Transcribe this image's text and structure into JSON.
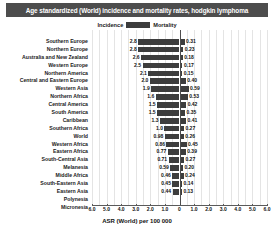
{
  "chart_data": {
    "type": "bar",
    "subtype": "diverging-butterfly",
    "title": "Age standardized (World) incidence and mortality rates, hodgkin lymphoma",
    "xlabel": "ASR (World) per 100 000",
    "ylabel": "",
    "grid": true,
    "legend_position": "top-center",
    "axis": {
      "left_ticks": [
        "6.0",
        "5.0",
        "4.0",
        "3.0",
        "2.0",
        "1.0",
        "0"
      ],
      "right_ticks": [
        "0",
        "1.0",
        "2.0",
        "3.0",
        "4.0",
        "5.0",
        "6.0"
      ],
      "left_max": 6.0,
      "right_max": 6.0
    },
    "series": [
      {
        "name": "Incidence",
        "side": "left",
        "color": "#3d3d3d"
      },
      {
        "name": "Mortality",
        "side": "right",
        "color": "#3d3d3d"
      }
    ],
    "categories": [
      "Southern Europe",
      "Northern Europe",
      "Australia and New Zealand",
      "Western Europe",
      "Northern America",
      "Central and Eastern Europe",
      "Western Asia",
      "Northern Africa",
      "Central America",
      "South America",
      "Caribbean",
      "Southern Africa",
      "World",
      "Western Africa",
      "Eastern Africa",
      "South-Central Asia",
      "Melanesia",
      "Middle Africa",
      "South-Eastern Asia",
      "Eastern Asia",
      "Polynesia",
      "Micronesia"
    ],
    "rows": [
      {
        "category": "Southern Europe",
        "incidence": "2.8",
        "incidence_value": 2.8,
        "mortality": "0.31",
        "mortality_value": 0.31
      },
      {
        "category": "Northern Europe",
        "incidence": "2.8",
        "incidence_value": 2.8,
        "mortality": "0.23",
        "mortality_value": 0.23
      },
      {
        "category": "Australia and New Zealand",
        "incidence": "2.6",
        "incidence_value": 2.6,
        "mortality": "0.18",
        "mortality_value": 0.18
      },
      {
        "category": "Western Europe",
        "incidence": "2.5",
        "incidence_value": 2.5,
        "mortality": "0.17",
        "mortality_value": 0.17
      },
      {
        "category": "Northern America",
        "incidence": "2.1",
        "incidence_value": 2.1,
        "mortality": "0.15",
        "mortality_value": 0.15
      },
      {
        "category": "Central and Eastern Europe",
        "incidence": "2.0",
        "incidence_value": 2.0,
        "mortality": "0.40",
        "mortality_value": 0.4
      },
      {
        "category": "Western Asia",
        "incidence": "1.9",
        "incidence_value": 1.9,
        "mortality": "0.59",
        "mortality_value": 0.59
      },
      {
        "category": "Northern Africa",
        "incidence": "1.6",
        "incidence_value": 1.6,
        "mortality": "0.53",
        "mortality_value": 0.53
      },
      {
        "category": "Central America",
        "incidence": "1.5",
        "incidence_value": 1.5,
        "mortality": "0.42",
        "mortality_value": 0.42
      },
      {
        "category": "South America",
        "incidence": "1.5",
        "incidence_value": 1.5,
        "mortality": "0.35",
        "mortality_value": 0.35
      },
      {
        "category": "Caribbean",
        "incidence": "1.3",
        "incidence_value": 1.3,
        "mortality": "0.41",
        "mortality_value": 0.41
      },
      {
        "category": "Southern Africa",
        "incidence": "1.0",
        "incidence_value": 1.0,
        "mortality": "0.27",
        "mortality_value": 0.27
      },
      {
        "category": "World",
        "incidence": "0.98",
        "incidence_value": 0.98,
        "mortality": "0.26",
        "mortality_value": 0.26
      },
      {
        "category": "Western Africa",
        "incidence": "0.86",
        "incidence_value": 0.86,
        "mortality": "0.45",
        "mortality_value": 0.45
      },
      {
        "category": "Eastern Africa",
        "incidence": "0.77",
        "incidence_value": 0.77,
        "mortality": "0.39",
        "mortality_value": 0.39
      },
      {
        "category": "South-Central Asia",
        "incidence": "0.71",
        "incidence_value": 0.71,
        "mortality": "0.27",
        "mortality_value": 0.27
      },
      {
        "category": "Melanesia",
        "incidence": "0.59",
        "incidence_value": 0.59,
        "mortality": "0.20",
        "mortality_value": 0.2
      },
      {
        "category": "Middle Africa",
        "incidence": "0.46",
        "incidence_value": 0.46,
        "mortality": "0.24",
        "mortality_value": 0.24
      },
      {
        "category": "South-Eastern Asia",
        "incidence": "0.45",
        "incidence_value": 0.45,
        "mortality": "0.14",
        "mortality_value": 0.14
      },
      {
        "category": "Eastern Asia",
        "incidence": "0.44",
        "incidence_value": 0.44,
        "mortality": "0.13",
        "mortality_value": 0.13
      },
      {
        "category": "Polynesia",
        "incidence": "",
        "incidence_value": 0,
        "mortality": "",
        "mortality_value": 0
      },
      {
        "category": "Micronesia",
        "incidence": "",
        "incidence_value": 0,
        "mortality": "",
        "mortality_value": 0
      }
    ]
  },
  "colors": {
    "title_bar": "#4d4d4d",
    "bar": "#3d3d3d",
    "grid": "#e4e4e4",
    "axis": "#5a5a5a"
  }
}
